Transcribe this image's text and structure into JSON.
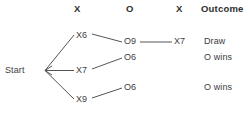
{
  "diagram": {
    "title_row": {
      "columns": [
        {
          "label": "X",
          "x": 74,
          "y": 3
        },
        {
          "label": "O",
          "x": 126,
          "y": 3
        },
        {
          "label": "X",
          "x": 176,
          "y": 3
        },
        {
          "label": "Outcome",
          "x": 201,
          "y": 3
        }
      ]
    },
    "start": {
      "label": "Start",
      "x": 5,
      "y": 65
    },
    "nodes": [
      {
        "id": "x6",
        "label": "X6",
        "x": 76,
        "y": 30
      },
      {
        "id": "o9",
        "label": "O9",
        "x": 124,
        "y": 36
      },
      {
        "id": "x7b",
        "label": "X7",
        "x": 174,
        "y": 36
      },
      {
        "id": "x7a",
        "label": "X7",
        "x": 76,
        "y": 65
      },
      {
        "id": "o6a",
        "label": "O6",
        "x": 124,
        "y": 52
      },
      {
        "id": "x9",
        "label": "X9",
        "x": 76,
        "y": 94
      },
      {
        "id": "o6b",
        "label": "O6",
        "x": 124,
        "y": 82
      }
    ],
    "outcomes": [
      {
        "id": "draw",
        "label": "Draw",
        "x": 204,
        "y": 36
      },
      {
        "id": "owins1",
        "label": "O wins",
        "x": 204,
        "y": 52
      },
      {
        "id": "owins2",
        "label": "O wins",
        "x": 204,
        "y": 82
      }
    ],
    "colors": {
      "line": "#555555",
      "text": "#3d3d3d",
      "header_text": "#2f2f2f",
      "background": "#ffffff"
    }
  }
}
